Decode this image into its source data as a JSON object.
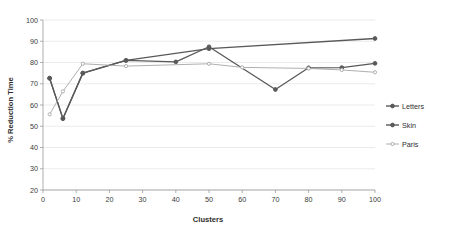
{
  "chart_data": {
    "type": "line",
    "title": "",
    "xlabel": "Clusters",
    "ylabel": "% Reduction Time",
    "xlim": [
      0,
      100
    ],
    "ylim": [
      20,
      100
    ],
    "xticks": [
      0,
      10,
      20,
      30,
      40,
      50,
      60,
      70,
      80,
      90,
      100
    ],
    "yticks": [
      20,
      30,
      40,
      50,
      60,
      70,
      80,
      90,
      100
    ],
    "grid": true,
    "legend_position": "right",
    "series": [
      {
        "name": "Letters",
        "color": "#595959",
        "x": [
          2,
          6,
          12,
          25,
          50,
          100
        ],
        "values": [
          72.6,
          53.6,
          75.0,
          81.0,
          86.5,
          91.3
        ]
      },
      {
        "name": "Skin",
        "color": "#595959",
        "x": [
          2,
          6,
          12,
          25,
          40,
          50,
          70,
          80,
          90,
          100
        ],
        "values": [
          72.6,
          53.6,
          75.0,
          81.0,
          80.3,
          87.4,
          67.3,
          77.5,
          77.6,
          79.6
        ]
      },
      {
        "name": "Paris",
        "color": "#a6a6a6",
        "x": [
          2,
          6,
          12,
          25,
          50,
          60,
          80,
          90,
          100
        ],
        "values": [
          55.6,
          66.4,
          79.4,
          78.3,
          79.4,
          77.7,
          77.2,
          76.5,
          75.4
        ]
      }
    ]
  },
  "legend": {
    "items": [
      {
        "label": "Letters",
        "color": "#595959"
      },
      {
        "label": "Skin",
        "color": "#595959"
      },
      {
        "label": "Paris",
        "color": "#a6a6a6"
      }
    ]
  },
  "axes": {
    "x_title": "Clusters",
    "y_title": "% Reduction Time",
    "x_tick_labels": [
      "0",
      "10",
      "20",
      "30",
      "40",
      "50",
      "60",
      "70",
      "80",
      "90",
      "100"
    ],
    "y_tick_labels": [
      "20",
      "30",
      "40",
      "50",
      "60",
      "70",
      "80",
      "90",
      "100"
    ]
  }
}
